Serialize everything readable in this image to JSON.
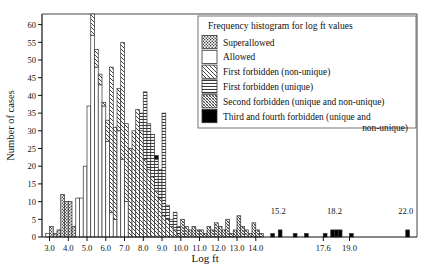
{
  "chart_data": {
    "type": "bar",
    "title": "Frequency histogram for log ft values",
    "xlabel": "Log ft",
    "ylabel": "Number of cases",
    "xlim": [
      2.6,
      22.6
    ],
    "ylim": [
      0,
      63
    ],
    "grid": false,
    "legend_position": "top-right",
    "bin_width": 0.2,
    "x_ticks": [
      "3.0",
      "4.0",
      "5.0",
      "6.0",
      "7.0",
      "8.0",
      "9.0",
      "10.0",
      "11.0",
      "12.0",
      "13.0",
      "14.0",
      "17.6",
      "19.0"
    ],
    "x_tick_values": [
      3.0,
      4.0,
      5.0,
      6.0,
      7.0,
      8.0,
      9.0,
      10.0,
      11.0,
      12.0,
      13.0,
      14.0,
      17.6,
      19.0
    ],
    "y_ticks": [
      "0",
      "5",
      "10",
      "15",
      "20",
      "25",
      "30",
      "35",
      "40",
      "45",
      "50",
      "55",
      "60"
    ],
    "y_tick_values": [
      0,
      5,
      10,
      15,
      20,
      25,
      30,
      35,
      40,
      45,
      50,
      55,
      60
    ],
    "annotations": [
      {
        "text": "15.2",
        "x": 15.2,
        "y": 6
      },
      {
        "text": "18.2",
        "x": 18.2,
        "y": 6
      },
      {
        "text": "22.0",
        "x": 22.0,
        "y": 6
      }
    ],
    "legend": [
      {
        "label": "Superallowed",
        "pattern": "dots"
      },
      {
        "label": "Allowed",
        "pattern": "blank"
      },
      {
        "label": "First forbidden (non-unique)",
        "pattern": "diag-sparse"
      },
      {
        "label": "First forbidden (unique)",
        "pattern": "horiz"
      },
      {
        "label": "Second forbidden (unique and non-unique)",
        "pattern": "diag-dense"
      },
      {
        "label": "Third and fourth forbidden (unique and",
        "label2": "non-unique)",
        "pattern": "solid"
      }
    ],
    "series": [
      {
        "name": "Superallowed",
        "pattern": "dots"
      },
      {
        "name": "Allowed",
        "pattern": "blank"
      },
      {
        "name": "First forbidden (non-unique)",
        "pattern": "diag-sparse"
      },
      {
        "name": "First forbidden (unique)",
        "pattern": "horiz"
      },
      {
        "name": "Second forbidden (unique and non-unique)",
        "pattern": "diag-dense"
      },
      {
        "name": "Third and fourth forbidden (unique and non-unique)",
        "pattern": "solid"
      }
    ],
    "bins": [
      {
        "x": 2.8,
        "stack": [
          {
            "p": "blank",
            "v": 1
          }
        ]
      },
      {
        "x": 3.0,
        "stack": [
          {
            "p": "dots",
            "v": 3
          }
        ]
      },
      {
        "x": 3.2,
        "stack": [
          {
            "p": "dots",
            "v": 1
          }
        ]
      },
      {
        "x": 3.4,
        "stack": [
          {
            "p": "dots",
            "v": 2
          }
        ]
      },
      {
        "x": 3.6,
        "stack": [
          {
            "p": "dots",
            "v": 12
          }
        ]
      },
      {
        "x": 3.8,
        "stack": [
          {
            "p": "dots",
            "v": 10
          }
        ]
      },
      {
        "x": 4.0,
        "stack": [
          {
            "p": "dots",
            "v": 10
          }
        ]
      },
      {
        "x": 4.2,
        "stack": [
          {
            "p": "dots",
            "v": 3
          }
        ]
      },
      {
        "x": 4.4,
        "stack": [
          {
            "p": "blank",
            "v": 11
          }
        ]
      },
      {
        "x": 4.6,
        "stack": [
          {
            "p": "blank",
            "v": 11
          }
        ]
      },
      {
        "x": 4.8,
        "stack": [
          {
            "p": "blank",
            "v": 20
          }
        ]
      },
      {
        "x": 5.0,
        "stack": [
          {
            "p": "blank",
            "v": 37
          }
        ]
      },
      {
        "x": 5.2,
        "stack": [
          {
            "p": "blank",
            "v": 57
          },
          {
            "p": "diag-sparse",
            "v": 6
          }
        ]
      },
      {
        "x": 5.4,
        "stack": [
          {
            "p": "blank",
            "v": 48
          },
          {
            "p": "diag-sparse",
            "v": 5
          }
        ]
      },
      {
        "x": 5.6,
        "stack": [
          {
            "p": "blank",
            "v": 43
          },
          {
            "p": "diag-sparse",
            "v": 3
          }
        ]
      },
      {
        "x": 5.8,
        "stack": [
          {
            "p": "blank",
            "v": 37
          },
          {
            "p": "diag-sparse",
            "v": 1
          }
        ]
      },
      {
        "x": 6.0,
        "stack": [
          {
            "p": "blank",
            "v": 27
          },
          {
            "p": "diag-sparse",
            "v": 6
          }
        ]
      },
      {
        "x": 6.2,
        "stack": [
          {
            "p": "blank",
            "v": 7
          },
          {
            "p": "diag-sparse",
            "v": 41
          }
        ]
      },
      {
        "x": 6.4,
        "stack": [
          {
            "p": "blank",
            "v": 5
          },
          {
            "p": "diag-sparse",
            "v": 26
          }
        ]
      },
      {
        "x": 6.6,
        "stack": [
          {
            "p": "blank",
            "v": 30
          },
          {
            "p": "diag-sparse",
            "v": 12
          }
        ]
      },
      {
        "x": 6.8,
        "stack": [
          {
            "p": "blank",
            "v": 22
          },
          {
            "p": "diag-sparse",
            "v": 33
          }
        ]
      },
      {
        "x": 7.0,
        "stack": [
          {
            "p": "blank",
            "v": 10
          },
          {
            "p": "diag-sparse",
            "v": 22
          }
        ]
      },
      {
        "x": 7.2,
        "stack": [
          {
            "p": "diag-sparse",
            "v": 25
          }
        ]
      },
      {
        "x": 7.4,
        "stack": [
          {
            "p": "diag-sparse",
            "v": 30
          }
        ]
      },
      {
        "x": 7.6,
        "stack": [
          {
            "p": "diag-sparse",
            "v": 36
          }
        ]
      },
      {
        "x": 7.8,
        "stack": [
          {
            "p": "diag-sparse",
            "v": 30
          },
          {
            "p": "horiz",
            "v": 5
          }
        ]
      },
      {
        "x": 8.0,
        "stack": [
          {
            "p": "diag-sparse",
            "v": 22
          },
          {
            "p": "horiz",
            "v": 19
          }
        ]
      },
      {
        "x": 8.2,
        "stack": [
          {
            "p": "diag-sparse",
            "v": 19
          },
          {
            "p": "horiz",
            "v": 13
          }
        ]
      },
      {
        "x": 8.4,
        "stack": [
          {
            "p": "diag-sparse",
            "v": 17
          },
          {
            "p": "horiz",
            "v": 12
          }
        ]
      },
      {
        "x": 8.6,
        "stack": [
          {
            "p": "diag-sparse",
            "v": 13
          },
          {
            "p": "horiz",
            "v": 9
          },
          {
            "p": "solid",
            "v": 1
          }
        ]
      },
      {
        "x": 8.8,
        "stack": [
          {
            "p": "diag-sparse",
            "v": 11
          },
          {
            "p": "horiz",
            "v": 8
          }
        ]
      },
      {
        "x": 9.0,
        "stack": [
          {
            "p": "diag-sparse",
            "v": 6
          },
          {
            "p": "horiz",
            "v": 29
          }
        ]
      },
      {
        "x": 9.2,
        "stack": [
          {
            "p": "diag-sparse",
            "v": 5
          },
          {
            "p": "horiz",
            "v": 4
          }
        ]
      },
      {
        "x": 9.4,
        "stack": [
          {
            "p": "diag-sparse",
            "v": 3
          },
          {
            "p": "horiz",
            "v": 2
          }
        ]
      },
      {
        "x": 9.6,
        "stack": [
          {
            "p": "diag-sparse",
            "v": 2
          },
          {
            "p": "horiz",
            "v": 5
          }
        ]
      },
      {
        "x": 9.8,
        "stack": [
          {
            "p": "diag-dense",
            "v": 1
          },
          {
            "p": "horiz",
            "v": 2
          }
        ]
      },
      {
        "x": 10.0,
        "stack": [
          {
            "p": "diag-dense",
            "v": 5
          }
        ]
      },
      {
        "x": 10.2,
        "stack": [
          {
            "p": "diag-dense",
            "v": 3
          }
        ]
      },
      {
        "x": 10.4,
        "stack": [
          {
            "p": "diag-dense",
            "v": 2
          }
        ]
      },
      {
        "x": 10.6,
        "stack": [
          {
            "p": "diag-dense",
            "v": 3
          }
        ]
      },
      {
        "x": 10.8,
        "stack": [
          {
            "p": "diag-dense",
            "v": 2
          }
        ]
      },
      {
        "x": 11.0,
        "stack": [
          {
            "p": "diag-dense",
            "v": 2
          }
        ]
      },
      {
        "x": 11.2,
        "stack": [
          {
            "p": "diag-dense",
            "v": 1
          }
        ]
      },
      {
        "x": 11.4,
        "stack": [
          {
            "p": "diag-dense",
            "v": 3
          }
        ]
      },
      {
        "x": 11.6,
        "stack": [
          {
            "p": "diag-dense",
            "v": 2
          }
        ]
      },
      {
        "x": 11.8,
        "stack": [
          {
            "p": "diag-dense",
            "v": 4
          }
        ]
      },
      {
        "x": 12.0,
        "stack": [
          {
            "p": "diag-dense",
            "v": 3
          }
        ]
      },
      {
        "x": 12.2,
        "stack": [
          {
            "p": "diag-dense",
            "v": 2
          }
        ]
      },
      {
        "x": 12.4,
        "stack": [
          {
            "p": "diag-dense",
            "v": 5
          }
        ]
      },
      {
        "x": 12.6,
        "stack": [
          {
            "p": "diag-dense",
            "v": 1
          }
        ]
      },
      {
        "x": 12.8,
        "stack": [
          {
            "p": "diag-dense",
            "v": 2
          }
        ]
      },
      {
        "x": 13.0,
        "stack": [
          {
            "p": "diag-dense",
            "v": 6
          }
        ]
      },
      {
        "x": 13.2,
        "stack": [
          {
            "p": "diag-dense",
            "v": 3
          }
        ]
      },
      {
        "x": 13.4,
        "stack": [
          {
            "p": "diag-dense",
            "v": 2
          }
        ]
      },
      {
        "x": 13.6,
        "stack": [
          {
            "p": "diag-dense",
            "v": 1
          }
        ]
      },
      {
        "x": 13.8,
        "stack": [
          {
            "p": "diag-dense",
            "v": 4
          }
        ]
      },
      {
        "x": 14.0,
        "stack": [
          {
            "p": "diag-dense",
            "v": 2
          }
        ]
      },
      {
        "x": 14.2,
        "stack": [
          {
            "p": "diag-dense",
            "v": 1
          }
        ]
      },
      {
        "x": 14.8,
        "stack": [
          {
            "p": "solid",
            "v": 1
          }
        ]
      },
      {
        "x": 15.2,
        "stack": [
          {
            "p": "solid",
            "v": 2
          }
        ]
      },
      {
        "x": 16.0,
        "stack": [
          {
            "p": "solid",
            "v": 1
          }
        ]
      },
      {
        "x": 16.6,
        "stack": [
          {
            "p": "solid",
            "v": 1
          }
        ]
      },
      {
        "x": 17.6,
        "stack": [
          {
            "p": "solid",
            "v": 1
          }
        ]
      },
      {
        "x": 18.0,
        "stack": [
          {
            "p": "solid",
            "v": 2
          }
        ]
      },
      {
        "x": 18.2,
        "stack": [
          {
            "p": "solid",
            "v": 2
          }
        ]
      },
      {
        "x": 18.4,
        "stack": [
          {
            "p": "solid",
            "v": 2
          }
        ]
      },
      {
        "x": 19.0,
        "stack": [
          {
            "p": "solid",
            "v": 1
          }
        ]
      },
      {
        "x": 22.0,
        "stack": [
          {
            "p": "solid",
            "v": 2
          }
        ]
      }
    ]
  }
}
